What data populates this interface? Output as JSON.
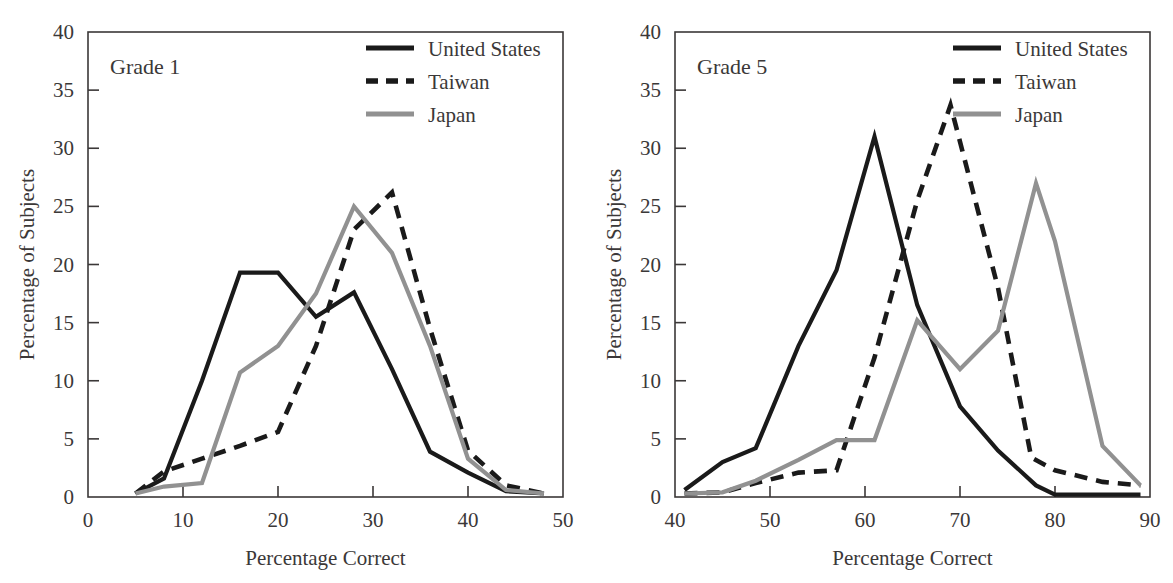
{
  "figure": {
    "panel_count": 2,
    "shared_xlabel": "Percentage Correct",
    "shared_ylabel": "Percentage of Subjects"
  },
  "legend": {
    "entries": [
      {
        "label": "United States",
        "style": "solid",
        "color": "#1a1a1a",
        "icon": "solid-line-swatch-icon"
      },
      {
        "label": "Taiwan",
        "style": "dashed",
        "color": "#1a1a1a",
        "icon": "dashed-line-swatch-icon"
      },
      {
        "label": "Japan",
        "style": "solid",
        "color": "#919191",
        "icon": "gray-line-swatch-icon"
      }
    ]
  },
  "left": {
    "panel_label": "Grade 1",
    "xlabel": "Percentage Correct",
    "ylabel": "Percentage of Subjects",
    "x_ticks": [
      "0",
      "10",
      "20",
      "30",
      "40",
      "50"
    ],
    "y_ticks": [
      "0",
      "5",
      "10",
      "15",
      "20",
      "25",
      "30",
      "35",
      "40"
    ],
    "legend_labels": [
      "United States",
      "Taiwan",
      "Japan"
    ]
  },
  "right": {
    "panel_label": "Grade 5",
    "xlabel": "Percentage Correct",
    "ylabel": "Percentage of Subjects",
    "x_ticks": [
      "40",
      "50",
      "60",
      "70",
      "80",
      "90"
    ],
    "y_ticks": [
      "0",
      "5",
      "10",
      "15",
      "20",
      "25",
      "30",
      "35",
      "40"
    ],
    "legend_labels": [
      "United States",
      "Taiwan",
      "Japan"
    ]
  },
  "chart_data": [
    {
      "type": "line",
      "title": "Grade 1",
      "xlabel": "Percentage Correct",
      "ylabel": "Percentage of Subjects",
      "xlim": [
        0,
        50
      ],
      "ylim": [
        0,
        40
      ],
      "xticks": [
        0,
        10,
        20,
        30,
        40,
        50
      ],
      "yticks": [
        0,
        5,
        10,
        15,
        20,
        25,
        30,
        35,
        40
      ],
      "grid": false,
      "legend_position": "top-right",
      "series": [
        {
          "name": "United States",
          "style": "solid",
          "color": "#1a1a1a",
          "x": [
            5,
            8,
            12,
            16,
            20,
            24,
            28,
            32,
            36,
            40,
            44,
            48
          ],
          "values": [
            0.3,
            1.6,
            10.0,
            19.3,
            19.3,
            15.5,
            17.6,
            11.0,
            3.9,
            2.1,
            0.5,
            0.3
          ]
        },
        {
          "name": "Taiwan",
          "style": "dashed",
          "color": "#1a1a1a",
          "x": [
            5,
            8,
            12,
            16,
            20,
            24,
            28,
            32,
            36,
            40,
            44,
            48
          ],
          "values": [
            0.3,
            2.2,
            3.3,
            4.4,
            5.6,
            13.0,
            23.0,
            26.2,
            14.5,
            4.0,
            1.0,
            0.3
          ]
        },
        {
          "name": "Japan",
          "style": "solid",
          "color": "#919191",
          "x": [
            5,
            8,
            12,
            16,
            20,
            24,
            28,
            32,
            36,
            40,
            44,
            48
          ],
          "values": [
            0.3,
            0.9,
            1.2,
            10.7,
            13.0,
            17.5,
            25.0,
            21.0,
            13.0,
            3.3,
            0.6,
            0.3
          ]
        }
      ]
    },
    {
      "type": "line",
      "title": "Grade 5",
      "xlabel": "Percentage Correct",
      "ylabel": "Percentage of Subjects",
      "xlim": [
        40,
        90
      ],
      "ylim": [
        0,
        40
      ],
      "xticks": [
        40,
        50,
        60,
        70,
        80,
        90
      ],
      "yticks": [
        0,
        5,
        10,
        15,
        20,
        25,
        30,
        35,
        40
      ],
      "grid": false,
      "legend_position": "top-right",
      "series": [
        {
          "name": "United States",
          "style": "solid",
          "color": "#1a1a1a",
          "x": [
            41,
            45,
            48.5,
            53,
            57,
            61,
            65.5,
            70,
            74,
            78,
            80,
            85,
            89
          ],
          "values": [
            0.6,
            3.0,
            4.2,
            13.0,
            19.5,
            31.0,
            16.5,
            7.8,
            4.0,
            1.0,
            0.2,
            0.2,
            0.2
          ]
        },
        {
          "name": "Taiwan",
          "style": "dashed",
          "color": "#1a1a1a",
          "x": [
            41,
            45,
            48.5,
            53,
            57,
            61,
            65.5,
            69,
            74,
            77.5,
            80,
            85,
            89
          ],
          "values": [
            0.3,
            0.4,
            1.2,
            2.1,
            2.3,
            12.0,
            25.5,
            33.7,
            18.0,
            3.4,
            2.3,
            1.3,
            1.0
          ]
        },
        {
          "name": "Japan",
          "style": "solid",
          "color": "#919191",
          "x": [
            41,
            45,
            48.5,
            53,
            57,
            61,
            65.5,
            70,
            74,
            78,
            80,
            85,
            89
          ],
          "values": [
            0.3,
            0.4,
            1.4,
            3.2,
            4.9,
            4.9,
            15.2,
            11.0,
            14.3,
            27.0,
            22.0,
            4.4,
            1.0
          ]
        }
      ]
    }
  ]
}
